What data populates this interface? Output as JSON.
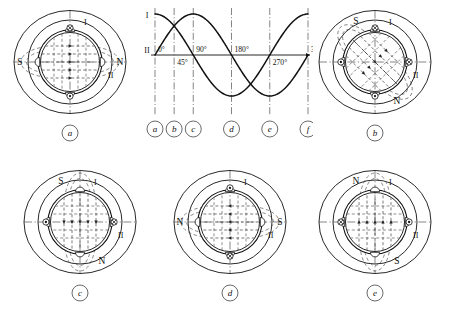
{
  "figure": {
    "panels": [
      {
        "key": "a",
        "caption": "a",
        "pole_labels": {
          "left": "S",
          "right": "N",
          "top": "",
          "bottom": ""
        },
        "coil_labels": {
          "phase1": "I",
          "phase2": "II"
        },
        "coils": {
          "top": "cross",
          "bottom": "dot",
          "left": "plain",
          "right": "plain"
        },
        "flux_axis_deg": 0,
        "phase_deg": 0
      },
      {
        "key": "b",
        "caption": "b",
        "pole_labels": {
          "left": "",
          "right": "",
          "top": "S",
          "bottom": "N"
        },
        "coil_labels": {
          "phase1": "I",
          "phase2": "II"
        },
        "coils": {
          "top": "cross",
          "bottom": "dot",
          "left": "dot",
          "right": "cross"
        },
        "flux_axis_deg": 45,
        "phase_deg": 45
      },
      {
        "key": "c",
        "caption": "c",
        "pole_labels": {
          "left": "",
          "right": "",
          "top": "S",
          "bottom": "N"
        },
        "coil_labels": {
          "phase1": "I",
          "phase2": "II"
        },
        "coils": {
          "top": "plain",
          "bottom": "plain",
          "left": "dot",
          "right": "cross"
        },
        "flux_axis_deg": 90,
        "phase_deg": 90
      },
      {
        "key": "d",
        "caption": "d",
        "pole_labels": {
          "left": "N",
          "right": "S",
          "top": "",
          "bottom": ""
        },
        "coil_labels": {
          "phase1": "I",
          "phase2": "II"
        },
        "coils": {
          "top": "dot",
          "bottom": "cross",
          "left": "plain",
          "right": "plain"
        },
        "flux_axis_deg": 180,
        "phase_deg": 180
      },
      {
        "key": "e",
        "caption": "e",
        "pole_labels": {
          "left": "",
          "right": "",
          "top": "N",
          "bottom": "S"
        },
        "coil_labels": {
          "phase1": "I",
          "phase2": "II"
        },
        "coils": {
          "top": "plain",
          "bottom": "plain",
          "left": "cross",
          "right": "dot"
        },
        "flux_axis_deg": 270,
        "phase_deg": 270
      }
    ],
    "markers": [
      "a",
      "b",
      "c",
      "d",
      "e",
      "f"
    ]
  },
  "chart_data": {
    "type": "line",
    "title": "",
    "xlabel": "",
    "ylabel": "",
    "x": [
      0,
      45,
      90,
      135,
      180,
      225,
      270,
      315,
      360
    ],
    "series": [
      {
        "name": "I",
        "values": [
          1.0,
          0.707,
          0.0,
          -0.707,
          -1.0,
          -0.707,
          0.0,
          0.707,
          1.0
        ]
      },
      {
        "name": "II",
        "values": [
          0.0,
          0.707,
          1.0,
          0.707,
          0.0,
          -0.707,
          -1.0,
          -0.707,
          0.0
        ]
      }
    ],
    "axis_labels": {
      "y_top": "I",
      "y_zero": "II"
    },
    "tick_labels": [
      "0°",
      "45°",
      "90°",
      "180°",
      "270°",
      "360°"
    ],
    "tick_values": [
      0,
      45,
      90,
      180,
      270,
      360
    ],
    "marker_labels": [
      "a",
      "b",
      "c",
      "d",
      "e",
      "f"
    ],
    "marker_values": [
      0,
      45,
      90,
      180,
      270,
      360
    ],
    "xlim": [
      0,
      360
    ],
    "ylim": [
      -1.15,
      1.15
    ],
    "grid": false,
    "legend": "none"
  },
  "colors": {
    "ink": "#111111",
    "dash": "#555555",
    "background": "#ffffff"
  }
}
